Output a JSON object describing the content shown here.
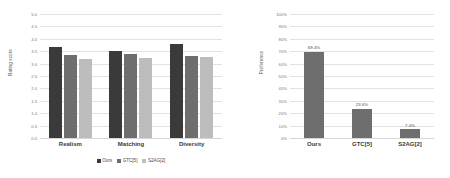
{
  "colors": {
    "ours": "#3a3a3a",
    "gtc": "#6e6e6e",
    "s2ag": "#bdbdbd",
    "grid": "#e2e2e2",
    "text": "#4a4a4a"
  },
  "left_chart": {
    "ylabel": "Rating score",
    "yticks": [
      "5.0",
      "4.5",
      "4.0",
      "3.5",
      "3.0",
      "2.5",
      "2.0",
      "1.5",
      "1.0",
      "0.5",
      "0.0"
    ],
    "categories": [
      "Realism",
      "Matching",
      "Diversity"
    ],
    "legend": [
      {
        "label": "Ours",
        "color": "#3a3a3a"
      },
      {
        "label": "GTC[5]",
        "color": "#6e6e6e"
      },
      {
        "label": "S2AG[2]",
        "color": "#bdbdbd"
      }
    ]
  },
  "right_chart": {
    "ylabel": "Preference",
    "yticks": [
      "100%",
      "90%",
      "80%",
      "70%",
      "60%",
      "50%",
      "40%",
      "30%",
      "20%",
      "10%",
      "0%"
    ],
    "categories": [
      "Ours",
      "GTC[5]",
      "S2AG[2]"
    ]
  },
  "chart_data": [
    {
      "type": "bar",
      "title": "",
      "xlabel": "",
      "ylabel": "Rating score",
      "ylim": [
        0.0,
        5.0
      ],
      "ytick_step": 0.5,
      "grid": true,
      "legend_position": "bottom",
      "categories": [
        "Realism",
        "Matching",
        "Diversity"
      ],
      "series": [
        {
          "name": "Ours",
          "color": "#3a3a3a",
          "values": [
            3.65,
            3.5,
            3.78
          ]
        },
        {
          "name": "GTC[5]",
          "color": "#6e6e6e",
          "values": [
            3.35,
            3.4,
            3.32
          ]
        },
        {
          "name": "S2AG[2]",
          "color": "#bdbdbd",
          "values": [
            3.18,
            3.22,
            3.28
          ]
        }
      ]
    },
    {
      "type": "bar",
      "title": "",
      "xlabel": "",
      "ylabel": "Preference",
      "ylim": [
        0,
        100
      ],
      "ytick_step": 10,
      "grid": true,
      "legend_position": "none",
      "categories": [
        "Ours",
        "GTC[5]",
        "S2AG[2]"
      ],
      "values": [
        69.4,
        23.6,
        7.0
      ],
      "data_labels": [
        "69.4%",
        "23.6%",
        "7.0%"
      ],
      "bar_color": "#6e6e6e"
    }
  ]
}
